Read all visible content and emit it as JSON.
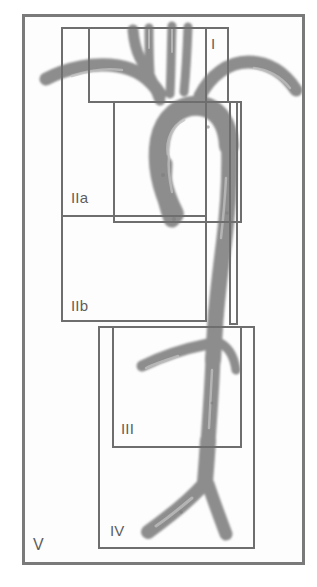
{
  "figure": {
    "modality": "angiography",
    "width": 317,
    "height": 587,
    "background_color": "#ffffff",
    "plate_color": "#fdfdfd",
    "vessel_color": "#8d8d8d",
    "vessel_shadow_color": "#a6a6a6",
    "vessel_highlight_color": "#c9c9c9",
    "box_stroke_color": "#6e6e6e",
    "outer_stroke_color": "#7a7a7a",
    "label_color": "#5d5d5d"
  },
  "zones": [
    {
      "id": "zone-1",
      "label": "I",
      "x": 88,
      "y": 27,
      "width": 141,
      "height": 76,
      "label_x": 211,
      "label_y": 36
    },
    {
      "id": "zone-2a",
      "label": "IIa",
      "x": 61,
      "y": 27,
      "width": 146,
      "height": 190,
      "label_x": 71,
      "label_y": 190
    },
    {
      "id": "zone-2b",
      "label": "IIb",
      "x": 61,
      "y": 215,
      "width": 146,
      "height": 107,
      "label_x": 71,
      "label_y": 298
    },
    {
      "id": "zone-3",
      "label": "III",
      "x": 112,
      "y": 326,
      "width": 130,
      "height": 122,
      "label_x": 121,
      "label_y": 421
    },
    {
      "id": "zone-4",
      "label": "IV",
      "x": 98,
      "y": 326,
      "width": 157,
      "height": 223,
      "label_x": 110,
      "label_y": 523
    },
    {
      "id": "zone-5",
      "label": "V",
      "x": 22,
      "y": 14,
      "width": 283,
      "height": 551,
      "label_x": 33,
      "label_y": 537
    },
    {
      "id": "zone-ascending",
      "label": "",
      "x": 113,
      "y": 101,
      "width": 129,
      "height": 122,
      "label_x": 0,
      "label_y": 0
    },
    {
      "id": "zone-descending",
      "label": "",
      "x": 229,
      "y": 101,
      "width": 9,
      "height": 224,
      "label_x": 0,
      "label_y": 0
    }
  ],
  "anatomy": {
    "structures": [
      "brachiocephalic-trunk",
      "right-subclavian-artery",
      "right-common-carotid-artery",
      "left-common-carotid-artery",
      "left-subclavian-artery",
      "ascending-aorta",
      "aortic-arch",
      "descending-thoracic-aorta",
      "abdominal-aorta",
      "renal-arteries",
      "aortic-bifurcation",
      "common-iliac-arteries"
    ]
  }
}
